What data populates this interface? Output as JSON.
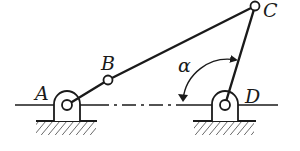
{
  "diagram": {
    "type": "four-bar linkage mechanism",
    "labels": {
      "A": "A",
      "B": "B",
      "C": "C",
      "D": "D",
      "angle": "α"
    },
    "points": {
      "A": [
        67,
        105
      ],
      "B": [
        108,
        80
      ],
      "C": [
        255,
        6
      ],
      "D": [
        225,
        105
      ]
    },
    "links": [
      {
        "from": "A",
        "to": "B",
        "name": "crank AB"
      },
      {
        "from": "B",
        "to": "C",
        "name": "coupler BC"
      },
      {
        "from": "C",
        "to": "D",
        "name": "rocker CD"
      }
    ],
    "fixed_supports": [
      "A",
      "D"
    ],
    "colors": {
      "stroke": "#1a1a1a",
      "background": "#ffffff"
    }
  }
}
